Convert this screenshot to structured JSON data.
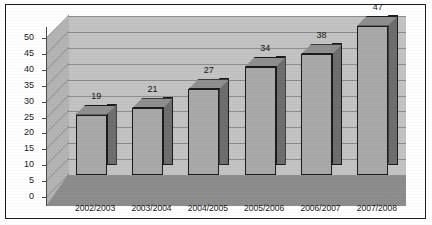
{
  "chart_data": {
    "type": "bar",
    "title": "",
    "subtitle": "",
    "xlabel": "",
    "ylabel": "",
    "categories": [
      "2002/2003",
      "2003/2004",
      "2004/2005",
      "2005/2006",
      "2006/2007",
      "2007/2008"
    ],
    "values": [
      19,
      21,
      27,
      34,
      38,
      47
    ],
    "data_labels": [
      "19",
      "21",
      "27",
      "34",
      "38",
      "47"
    ],
    "ylim": [
      0,
      50
    ],
    "ytick_step": 5,
    "ytick_labels": [
      "50",
      "45",
      "40",
      "35",
      "30",
      "25",
      "20",
      "15",
      "10",
      "5",
      "0"
    ],
    "ytick_values": [
      50,
      45,
      40,
      35,
      30,
      25,
      20,
      15,
      10,
      5,
      0
    ],
    "grid": true,
    "grid_axis": "y",
    "legend": false,
    "legend_position": "none",
    "style": "3d-column",
    "annotations": []
  },
  "colors": {
    "bar_front": "#a9a9a9",
    "bar_side": "#6e6e6e",
    "bar_top": "#8f8f8f",
    "bar_outline": "#1b1b1b",
    "back_wall": "#c3c3c3",
    "left_wall": "#b4b4b4",
    "floor": "#8d8d8d",
    "gridline": "#8e8e8e",
    "axis": "#4a4a4a",
    "border": "#1c1c1c",
    "text": "#151515",
    "background": "#ffffff"
  }
}
